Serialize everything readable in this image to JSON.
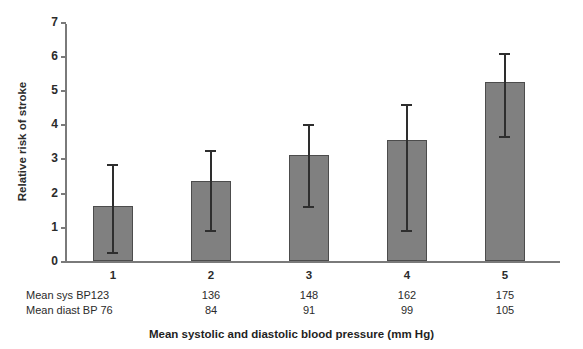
{
  "chart_data": {
    "type": "bar",
    "title": "",
    "xlabel": "Mean systolic and diastolic blood pressure (mm Hg)",
    "ylabel": "Relative risk of stroke",
    "categories": [
      "1",
      "2",
      "3",
      "4",
      "5"
    ],
    "values": [
      1.6,
      2.35,
      3.1,
      3.55,
      5.25
    ],
    "error_low": [
      0.2,
      0.85,
      1.55,
      0.85,
      3.6
    ],
    "error_high": [
      2.85,
      3.25,
      4.0,
      4.6,
      6.1
    ],
    "ylim": [
      0,
      7
    ],
    "yticks": [
      0,
      1,
      2,
      3,
      4,
      5,
      6,
      7
    ],
    "ytick_labels": [
      "0",
      "1",
      "2",
      "3",
      "4",
      "5",
      "6",
      "7"
    ],
    "xtick_labels": [
      "1",
      "2",
      "3",
      "4",
      "5"
    ],
    "grid": false,
    "legend": false,
    "bar_color": "#808080",
    "bar_edge_color": "#4c4c4c",
    "error_color": "#2e2e2e",
    "axis_color": "#7a7a7a",
    "series": [
      {
        "name": "Relative risk of stroke",
        "values": [
          1.6,
          2.35,
          3.1,
          3.55,
          5.25
        ]
      }
    ],
    "annotation_rows": [
      {
        "label": "Mean sys BP123",
        "values": [
          "136",
          "148",
          "162",
          "175"
        ]
      },
      {
        "label": "Mean diast BP 76",
        "values": [
          "84",
          "91",
          "99",
          "105"
        ]
      }
    ]
  },
  "axes": {
    "y_title": "Relative risk of stroke",
    "x_title": "Mean systolic and diastolic blood pressure (mm Hg)"
  },
  "table": {
    "group_labels": [
      "1",
      "2",
      "3",
      "4",
      "5"
    ],
    "sys_header": "Mean sys BP123",
    "diast_header": "Mean diast BP 76",
    "sys_values": [
      "136",
      "148",
      "162",
      "175"
    ],
    "diast_values": [
      "84",
      "91",
      "99",
      "105"
    ]
  },
  "ticks": {
    "y": [
      "0",
      "1",
      "2",
      "3",
      "4",
      "5",
      "6",
      "7"
    ]
  }
}
